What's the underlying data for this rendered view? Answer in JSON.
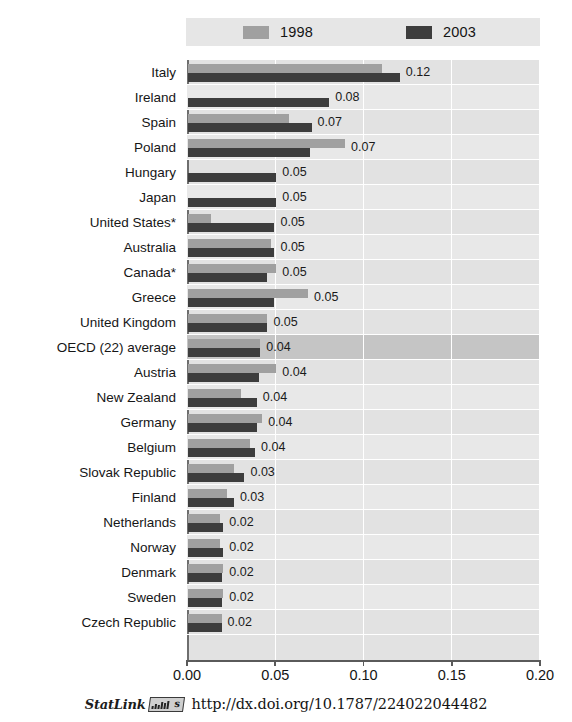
{
  "chart_data": {
    "type": "bar",
    "orientation": "horizontal",
    "title": "",
    "subtitle": "",
    "xlabel": "",
    "ylabel": "",
    "xlim": [
      0.0,
      0.2
    ],
    "grid": true,
    "legend_position": "top",
    "tick_labels": [
      "0.00",
      "0.05",
      "0.10",
      "0.15",
      "0.20"
    ],
    "tick_values": [
      0.0,
      0.05,
      0.1,
      0.15,
      0.2
    ],
    "series": [
      {
        "name": "1998",
        "color": "#a0a0a0",
        "values": [
          0.11,
          0.0,
          0.057,
          0.089,
          0.0,
          0.0,
          0.013,
          0.047,
          0.05,
          0.068,
          0.045,
          0.041,
          0.05,
          0.03,
          0.042,
          0.035,
          0.026,
          0.022,
          0.018,
          0.018,
          0.02,
          0.02,
          0.019
        ]
      },
      {
        "name": "2003",
        "color": "#3d3d3d",
        "values": [
          0.12,
          0.08,
          0.07,
          0.069,
          0.05,
          0.05,
          0.049,
          0.049,
          0.045,
          0.049,
          0.045,
          0.041,
          0.04,
          0.039,
          0.039,
          0.038,
          0.032,
          0.026,
          0.02,
          0.02,
          0.019,
          0.019,
          0.019
        ]
      }
    ],
    "categories": [
      "Italy",
      "Ireland",
      "Spain",
      "Poland",
      "Hungary",
      "Japan",
      "United States*",
      "Australia",
      "Canada*",
      "Greece",
      "United Kingdom",
      "OECD (22) average",
      "Austria",
      "New Zealand",
      "Germany",
      "Belgium",
      "Slovak Republic",
      "Finland",
      "Netherlands",
      "Norway",
      "Denmark",
      "Sweden",
      "Czech Republic"
    ],
    "data_labels": [
      "0.12",
      "0.08",
      "0.07",
      "0.07",
      "0.05",
      "0.05",
      "0.05",
      "0.05",
      "0.05",
      "0.05",
      "0.05",
      "0.04",
      "0.04",
      "0.04",
      "0.04",
      "0.04",
      "0.03",
      "0.03",
      "0.02",
      "0.02",
      "0.02",
      "0.02",
      "0.02"
    ],
    "highlight_row": "OECD (22) average",
    "highlight_index": 11
  },
  "legend": {
    "items": [
      {
        "label": "1998",
        "color": "#a0a0a0"
      },
      {
        "label": "2003",
        "color": "#3d3d3d"
      }
    ]
  },
  "footer": {
    "statlink_label": "StatLink",
    "doi_url": "http://dx.doi.org/10.1787/224022044482"
  },
  "colors": {
    "series_1998": "#a0a0a0",
    "series_2003": "#3d3d3d",
    "plot_background": "#e2e2e2",
    "highlight_band": "#c5c5c5",
    "gridline": "#ffffff",
    "axis": "#5a5a5a"
  }
}
